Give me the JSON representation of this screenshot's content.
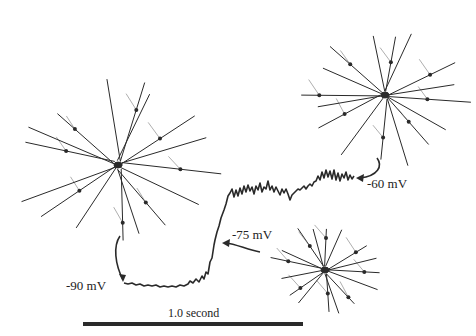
{
  "figure": {
    "colors": {
      "ink": "#2a2a2a",
      "background": "#ffffff"
    }
  },
  "labels": {
    "v1": "-90 mV",
    "v2": "-75 mV",
    "v3": "-60 mV",
    "scale": "1.0 second"
  },
  "neurons": [
    {
      "id": "neuron-large-left",
      "cx": 118,
      "cy": 165,
      "r": 100,
      "state": "-90 mV"
    },
    {
      "id": "neuron-top-right",
      "cx": 385,
      "cy": 95,
      "r": 85,
      "state": "-60 mV"
    },
    {
      "id": "neuron-bottom-right",
      "cx": 325,
      "cy": 270,
      "r": 55,
      "state": "-75 mV"
    }
  ],
  "scale_bar": {
    "x1": 83,
    "x2": 303,
    "y": 324,
    "label": "1.0 second"
  }
}
